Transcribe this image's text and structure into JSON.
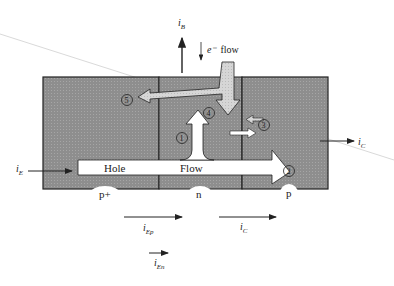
{
  "diagram": {
    "regions": [
      {
        "id": "emitter",
        "label": "p+"
      },
      {
        "id": "base",
        "label": "n"
      },
      {
        "id": "collector",
        "label": "p"
      }
    ],
    "hole_flow": {
      "word1": "Hole",
      "word2": "Flow"
    },
    "electron_flow": {
      "label_sym": "e⁻",
      "label_word": "flow"
    },
    "markers": [
      "1",
      "2",
      "3",
      "4",
      "5"
    ],
    "currents": {
      "iB": {
        "sym": "i",
        "sub": "B"
      },
      "iE": {
        "sym": "i",
        "sub": "E"
      },
      "iC_right": {
        "sym": "i",
        "sub": "C"
      },
      "iEp": {
        "sym": "i",
        "sub": "Ep"
      },
      "iC_bottom": {
        "sym": "i",
        "sub": "C"
      },
      "iEn": {
        "sym": "i",
        "sub": "En"
      }
    },
    "colors": {
      "region_fill": "#8f8f8f",
      "border": "#222222",
      "arrow_fill": "#ffffff",
      "electron_arrow_fill": "#d8d8d8"
    }
  }
}
